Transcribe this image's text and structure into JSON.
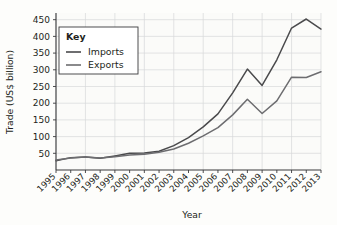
{
  "chart_data": {
    "type": "line",
    "title": "",
    "xlabel": "Year",
    "ylabel": "Trade (US$ billion)",
    "x": [
      1995,
      1996,
      1997,
      1998,
      1999,
      2000,
      2001,
      2002,
      2003,
      2004,
      2005,
      2006,
      2007,
      2008,
      2009,
      2010,
      2011,
      2012,
      2013
    ],
    "xtick_labels": [
      "1995",
      "1996",
      "1997",
      "1998",
      "1999",
      "2000",
      "2001",
      "2002",
      "2003",
      "2004",
      "2005",
      "2006",
      "2007",
      "2008",
      "2009",
      "2010",
      "2011",
      "2012",
      "2013"
    ],
    "ytick_labels": [
      "50",
      "100",
      "150",
      "200",
      "250",
      "300",
      "350",
      "400",
      "450"
    ],
    "ytick_values": [
      50,
      100,
      150,
      200,
      250,
      300,
      350,
      400,
      450
    ],
    "ylim": [
      0,
      470
    ],
    "xlim": [
      1995,
      2013
    ],
    "grid": true,
    "legend_position": "upper-left-inside",
    "legend_title": "Key",
    "series": [
      {
        "name": "Imports",
        "color": "#4a4a4c",
        "values": [
          28,
          37,
          39,
          35,
          42,
          50,
          51,
          56,
          73,
          97,
          129,
          168,
          231,
          302,
          253,
          330,
          425,
          452,
          422
        ]
      },
      {
        "name": "Exports",
        "color": "#6d6d70",
        "values": [
          30,
          36,
          39,
          36,
          40,
          45,
          47,
          53,
          63,
          80,
          102,
          127,
          165,
          212,
          169,
          207,
          278,
          277,
          294
        ]
      }
    ]
  },
  "legend": {
    "title": "Key",
    "entries": [
      {
        "label": "Imports"
      },
      {
        "label": "Exports"
      }
    ]
  },
  "axes": {
    "y_title": "Trade (US$ billion)",
    "x_title": "Year"
  }
}
